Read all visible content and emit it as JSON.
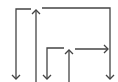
{
  "diagram": {
    "type": "arrow-line-diagram",
    "background": "#ffffff",
    "stroke_color": "#444444",
    "stroke_width": 1.3,
    "width": 118,
    "height": 82,
    "paths": [
      {
        "id": "left-bracket",
        "points": [
          [
            31,
            9
          ],
          [
            16,
            9
          ],
          [
            16,
            79
          ]
        ],
        "arrow_end": "down"
      },
      {
        "id": "center-up-arrow",
        "points": [
          [
            36,
            82
          ],
          [
            36,
            10
          ]
        ],
        "arrow_end": "up"
      },
      {
        "id": "right-bracket",
        "points": [
          [
            42,
            8
          ],
          [
            110,
            8
          ],
          [
            110,
            79
          ]
        ],
        "arrow_end": "down"
      },
      {
        "id": "inner-left-bracket",
        "points": [
          [
            64,
            48
          ],
          [
            47,
            48
          ],
          [
            47,
            79
          ]
        ],
        "arrow_end": "down"
      },
      {
        "id": "inner-up-arrow",
        "points": [
          [
            69,
            82
          ],
          [
            69,
            50
          ]
        ],
        "arrow_end": "up"
      },
      {
        "id": "inner-right-arrow",
        "points": [
          [
            75,
            49
          ],
          [
            108,
            49
          ]
        ],
        "arrow_end": "right"
      }
    ]
  }
}
